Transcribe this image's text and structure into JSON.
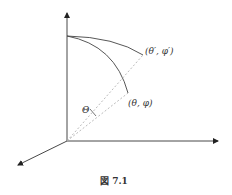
{
  "diagram": {
    "labels": {
      "point_prime": "(θ′, φ′)",
      "point": "(θ, φ)",
      "angle": "Θ"
    },
    "caption": "図 7.1",
    "colors": {
      "line": "#333333",
      "dashed": "#aaaaaa",
      "background": "#ffffff"
    }
  }
}
